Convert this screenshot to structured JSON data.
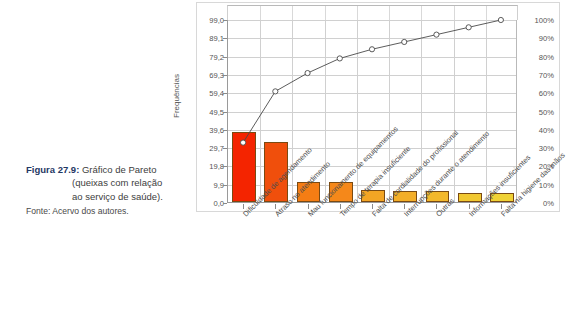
{
  "caption": {
    "figure_number": "Figura 27.9:",
    "line1": "Gráfico de Pareto",
    "line2": "(queixas com relação",
    "line3": "ao serviço de saúde).",
    "source": "Fonte: Acervo dos autores.",
    "number_color": "#1f3864",
    "text_color": "#3d3d3d"
  },
  "chart_data": {
    "type": "bar",
    "title": "",
    "subtitle": "",
    "xlabel": "",
    "ylabel": "Frequências",
    "y2label": "",
    "ylim": [
      0,
      99
    ],
    "y2lim": [
      0,
      100
    ],
    "grid": true,
    "legend": "none",
    "categories": [
      "Dificuldade de agendamento",
      "Atraso no atendimento",
      "Mau funcionamento de equipamentos",
      "Tempo de terapia insuficiente",
      "Falta de cordialidade do profissional",
      "Interrupções durante o atendimento",
      "Outras",
      "Informações insuficientes",
      "Falta na higiene das mãos"
    ],
    "series": [
      {
        "name": "Frequências",
        "type": "bar",
        "values": [
          38.0,
          32.5,
          11.0,
          11.0,
          6.5,
          6.0,
          6.0,
          5.0,
          5.0
        ],
        "colors": [
          "#f42400",
          "#f04f0c",
          "#f57d14",
          "#f5881a",
          "#f3a524",
          "#f3ae28",
          "#f3b82c",
          "#f1c831",
          "#f0d236"
        ]
      },
      {
        "name": "Percentual acumulado",
        "type": "line",
        "values": [
          33,
          61,
          71,
          79,
          84,
          88,
          92,
          96,
          100
        ],
        "line_color": "#4a4a4a",
        "marker": "open-circle"
      }
    ],
    "y_ticks": [
      "99,0",
      "89,1",
      "79,2",
      "69,3",
      "59,4",
      "49,5",
      "39,6",
      "29,7",
      "19,8",
      "9,9",
      "0,0"
    ],
    "y_tick_values": [
      99.0,
      89.1,
      79.2,
      69.3,
      59.4,
      49.5,
      39.6,
      29.7,
      19.8,
      9.9,
      0.0
    ],
    "y2_ticks": [
      "100%",
      "90%",
      "80%",
      "70%",
      "60%",
      "50%",
      "40%",
      "30%",
      "20%",
      "10%",
      "0%"
    ],
    "y2_tick_values": [
      100,
      90,
      80,
      70,
      60,
      50,
      40,
      30,
      20,
      10,
      0
    ]
  }
}
